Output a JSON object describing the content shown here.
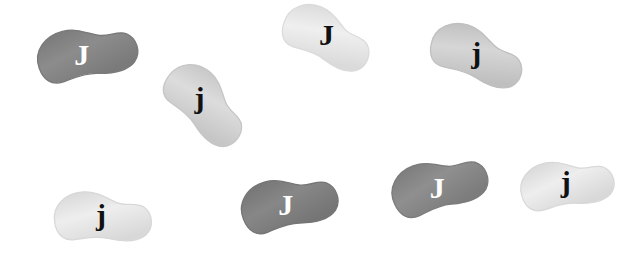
{
  "scene": {
    "title": "Jelly beans with letter J labels",
    "background_color": "#ffffff",
    "width": 641,
    "height": 259,
    "bean_count": 8
  },
  "beans": [
    {
      "id": "bean-1",
      "letter": "J",
      "letter_case": "uppercase",
      "fill_color": "#8c8c8c",
      "edge_color": "#7a7a7a",
      "letter_color": "#ffffff",
      "x": 30,
      "y": 23,
      "w": 112,
      "h": 58,
      "rotation": -14,
      "letter_x": 51,
      "letter_y": 31,
      "letter_size": 30
    },
    {
      "id": "bean-2",
      "letter": "j",
      "letter_case": "lowercase",
      "fill_color": "#dcdcdc",
      "edge_color": "#c6c6c6",
      "letter_color": "#111111",
      "x": 154,
      "y": 74,
      "w": 104,
      "h": 58,
      "rotation": 42,
      "letter_x": 44,
      "letter_y": 30,
      "letter_size": 30
    },
    {
      "id": "bean-3",
      "letter": "J",
      "letter_case": "uppercase",
      "fill_color": "#efefef",
      "edge_color": "#dadada",
      "letter_color": "#111111",
      "x": 276,
      "y": 8,
      "w": 102,
      "h": 56,
      "rotation": 22,
      "letter_x": 50,
      "letter_y": 27,
      "letter_size": 30
    },
    {
      "id": "bean-4",
      "letter": "j",
      "letter_case": "lowercase",
      "fill_color": "#d6d6d6",
      "edge_color": "#bfbfbf",
      "letter_color": "#111111",
      "x": 424,
      "y": 26,
      "w": 106,
      "h": 56,
      "rotation": 18,
      "letter_x": 52,
      "letter_y": 27,
      "letter_size": 30
    },
    {
      "id": "bean-5",
      "letter": "j",
      "letter_case": "lowercase",
      "fill_color": "#eeeeee",
      "edge_color": "#d8d8d8",
      "letter_color": "#111111",
      "x": 48,
      "y": 188,
      "w": 108,
      "h": 56,
      "rotation": -2,
      "letter_x": 53,
      "letter_y": 27,
      "letter_size": 30
    },
    {
      "id": "bean-6",
      "letter": "J",
      "letter_case": "uppercase",
      "fill_color": "#878787",
      "edge_color": "#757575",
      "letter_color": "#ffffff",
      "x": 234,
      "y": 173,
      "w": 108,
      "h": 58,
      "rotation": -16,
      "letter_x": 51,
      "letter_y": 31,
      "letter_size": 30
    },
    {
      "id": "bean-7",
      "letter": "J",
      "letter_case": "uppercase",
      "fill_color": "#8f8f8f",
      "edge_color": "#7c7c7c",
      "letter_color": "#ffffff",
      "x": 384,
      "y": 155,
      "w": 108,
      "h": 58,
      "rotation": -20,
      "letter_x": 52,
      "letter_y": 32,
      "letter_size": 30
    },
    {
      "id": "bean-8",
      "letter": "j",
      "letter_case": "lowercase",
      "fill_color": "#eeeeee",
      "edge_color": "#d8d8d8",
      "letter_color": "#111111",
      "x": 514,
      "y": 156,
      "w": 104,
      "h": 54,
      "rotation": -12,
      "letter_x": 52,
      "letter_y": 26,
      "letter_size": 30
    }
  ]
}
